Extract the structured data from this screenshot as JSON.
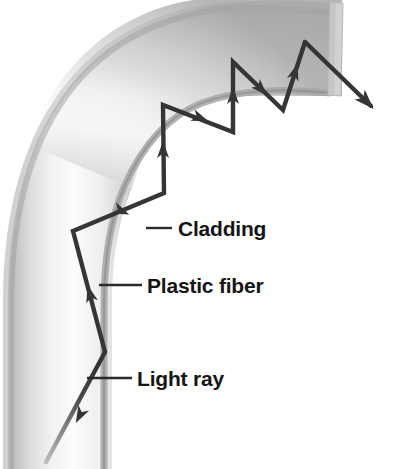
{
  "figure": {
    "background_color": "#ffffff",
    "width": 399,
    "height": 469
  },
  "labels": [
    {
      "id": "cladding",
      "text": "Cladding",
      "text_x": 178,
      "text_y": 236,
      "leader": {
        "x1": 146,
        "y1": 228,
        "x2": 172,
        "y2": 228
      }
    },
    {
      "id": "plastic-fiber",
      "text": "Plastic fiber",
      "text_x": 147,
      "text_y": 293,
      "leader": {
        "x1": 99,
        "y1": 285,
        "x2": 142,
        "y2": 285
      }
    },
    {
      "id": "light-ray",
      "text": "Light ray",
      "text_x": 137,
      "text_y": 386,
      "leader": {
        "x1": 87,
        "y1": 378,
        "x2": 132,
        "y2": 378
      }
    }
  ],
  "fiber": {
    "name": "plastic-fiber-body",
    "description": "Curved tube bending from bottom-left vertically up and around to the right",
    "core_color_light": "#fbfbfb",
    "core_color_mid": "#e9e9e9",
    "cladding_color": "#b9b9b9",
    "cladding_edge_color": "#9a9a9a",
    "end_face_color": "#c9c9c9",
    "outer_path": "M 6 469 L 6 300 C 6 176 70 72 172 30 C 220 11 276 5 330 9 L 330 9",
    "inner_path": "M 104 469 L 104 315 C 104 225 150 148 225 112 C 262 95 300 88 335 90"
  },
  "ray": {
    "name": "light-ray-path",
    "stroke_color": "#353535",
    "entry_stroke_color": "#8d8d8d",
    "stroke_width": 4.2,
    "vertices": [
      {
        "x": 46,
        "y": 462,
        "note": "entry point outside fiber, faded"
      },
      {
        "x": 105,
        "y": 352,
        "note": "first reflection, inner wall"
      },
      {
        "x": 73,
        "y": 231,
        "note": "second reflection, outer wall"
      },
      {
        "x": 164,
        "y": 193,
        "note": "third reflection, inner wall"
      },
      {
        "x": 163,
        "y": 105,
        "note": "fourth reflection, outer wall"
      },
      {
        "x": 233,
        "y": 132,
        "note": "fifth reflection, inner wall"
      },
      {
        "x": 233,
        "y": 62,
        "note": "sixth reflection, outer wall"
      },
      {
        "x": 283,
        "y": 110,
        "note": "seventh reflection, inner wall"
      },
      {
        "x": 305,
        "y": 42,
        "note": "eighth reflection, outer wall near end"
      },
      {
        "x": 376,
        "y": 111,
        "note": "exit ray tip outside fiber"
      }
    ],
    "arrow_markers": [
      {
        "x": 78,
        "y": 417,
        "angle": 298
      },
      {
        "x": 92,
        "y": 290,
        "angle": 285
      },
      {
        "x": 120,
        "y": 212,
        "angle": 23
      },
      {
        "x": 164,
        "y": 150,
        "angle": 270
      },
      {
        "x": 197,
        "y": 117,
        "angle": 21
      },
      {
        "x": 233,
        "y": 97,
        "angle": 270
      },
      {
        "x": 259,
        "y": 85,
        "angle": 316
      },
      {
        "x": 294,
        "y": 75,
        "angle": 288
      },
      {
        "x": 343,
        "y": 78,
        "angle": 44
      }
    ]
  },
  "colors": {
    "ink": "#151515",
    "leader_line": "#303030",
    "fiber_light": "#fbfbfb",
    "fiber_shadow": "#c4c4c4",
    "cladding": "#b0b0b0"
  }
}
